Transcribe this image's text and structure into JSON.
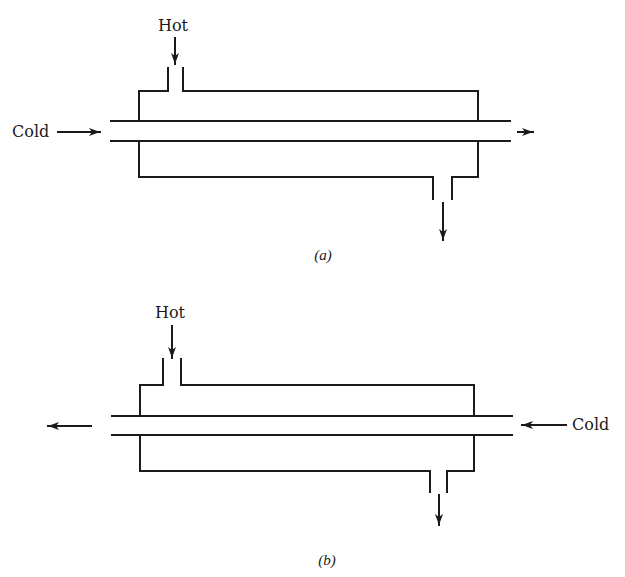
{
  "figure": {
    "type": "double-pipe heat exchanger flow arrangements",
    "panels": [
      {
        "id": "a",
        "caption": "(a)",
        "arrangement": "parallel flow",
        "hot_label": "Hot",
        "cold_label": "Cold",
        "hot_inlet": "top-left nozzle, flowing down into shell",
        "hot_outlet": "bottom-right nozzle, flowing down",
        "cold_inlet": "left end of inner tube",
        "cold_outlet": "right end of inner tube"
      },
      {
        "id": "b",
        "caption": "(b)",
        "arrangement": "counterflow",
        "hot_label": "Hot",
        "cold_label": "Cold",
        "hot_inlet": "top-left nozzle, flowing down into shell",
        "hot_outlet": "bottom-right nozzle, flowing down",
        "cold_inlet": "right end of inner tube",
        "cold_outlet": "left end of inner tube"
      }
    ],
    "colors": {
      "line": "#1a1a1a",
      "background": "#ffffff"
    }
  }
}
